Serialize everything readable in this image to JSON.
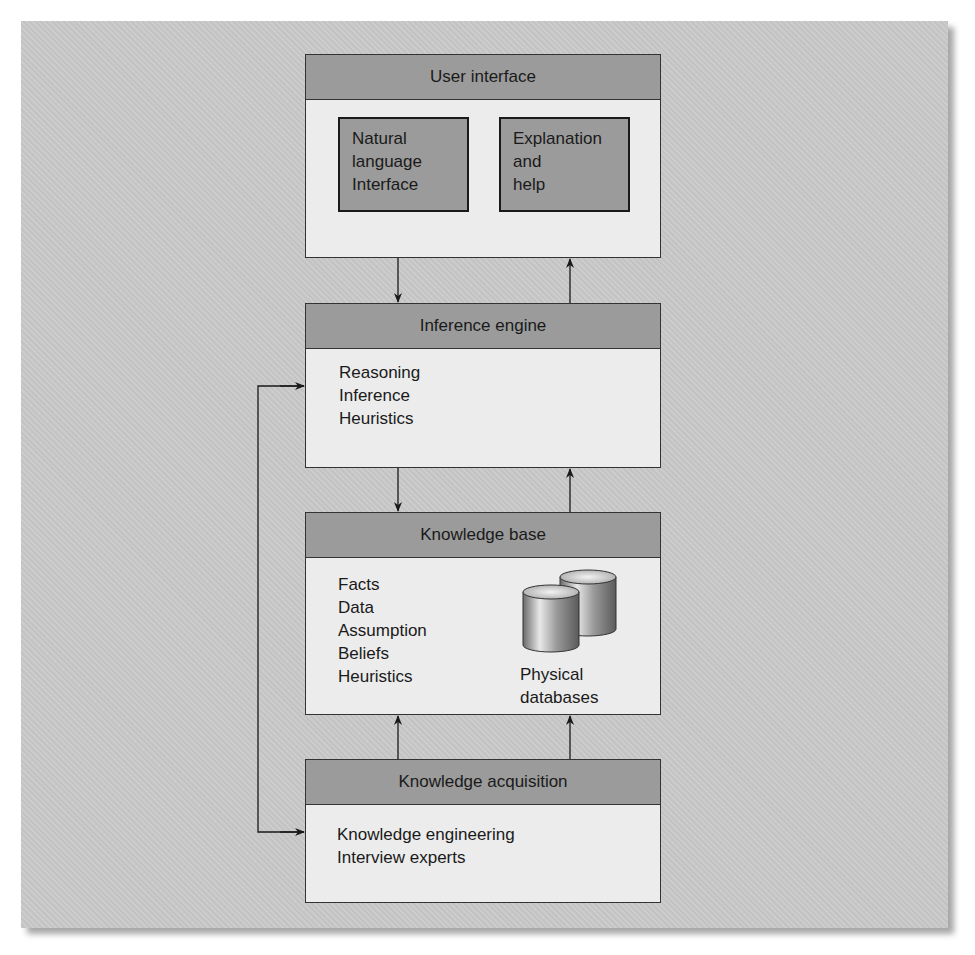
{
  "diagram": {
    "user_interface": {
      "title": "User interface",
      "components": [
        {
          "lines": [
            "Natural",
            "language",
            "Interface"
          ]
        },
        {
          "lines": [
            "Explanation",
            "and",
            "help"
          ]
        }
      ]
    },
    "inference_engine": {
      "title": "Inference engine",
      "items": [
        "Reasoning",
        "Inference",
        "Heuristics"
      ]
    },
    "knowledge_base": {
      "title": "Knowledge base",
      "items": [
        "Facts",
        "Data",
        "Assumption",
        "Beliefs",
        "Heuristics"
      ],
      "database_icon": "database-cylinders-icon",
      "database_label": [
        "Physical",
        "databases"
      ]
    },
    "knowledge_acquisition": {
      "title": "Knowledge acquisition",
      "items": [
        "Knowledge engineering",
        "Interview experts"
      ]
    },
    "connections": [
      {
        "from": "User interface",
        "to": "Inference engine",
        "direction": "down"
      },
      {
        "from": "Inference engine",
        "to": "User interface",
        "direction": "up"
      },
      {
        "from": "Inference engine",
        "to": "Knowledge base",
        "direction": "down"
      },
      {
        "from": "Knowledge base",
        "to": "Inference engine",
        "direction": "up"
      },
      {
        "from": "Knowledge acquisition",
        "to": "Knowledge base",
        "direction": "up"
      },
      {
        "from": "Knowledge acquisition",
        "to": "Knowledge base",
        "direction": "up"
      },
      {
        "from": "side-loop",
        "to": "Inference engine",
        "direction": "right"
      },
      {
        "from": "side-loop",
        "to": "Knowledge acquisition",
        "direction": "right"
      }
    ],
    "colors": {
      "panel": "#c9c9c9",
      "header": "#9b9b9b",
      "body": "#ececec",
      "border": "#333333"
    }
  }
}
